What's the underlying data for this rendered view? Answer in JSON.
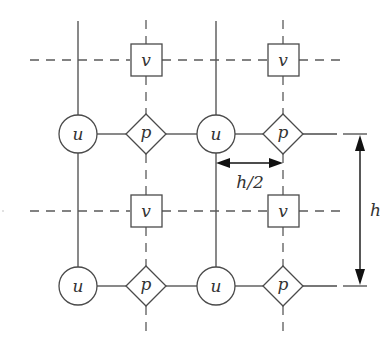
{
  "diagram": {
    "colors": {
      "line": "#4a4a4a",
      "dashed": "#5a5a5a",
      "dimension": "#111111",
      "text": "#333333",
      "background": "#ffffff"
    },
    "u_columns_x": [
      78,
      216
    ],
    "p_columns_x": [
      146,
      283
    ],
    "v_rows_y": [
      60,
      211
    ],
    "pu_rows_y": [
      134,
      286
    ],
    "legend_nodes": {
      "u": {
        "shape": "circle",
        "label": "u"
      },
      "v": {
        "shape": "square",
        "label": "v"
      },
      "p": {
        "shape": "diamond",
        "label": "p"
      }
    },
    "nodes": [
      {
        "type": "v",
        "label": "v",
        "x": 146,
        "y": 60
      },
      {
        "type": "v",
        "label": "v",
        "x": 283,
        "y": 60
      },
      {
        "type": "u",
        "label": "u",
        "x": 78,
        "y": 134
      },
      {
        "type": "p",
        "label": "p",
        "x": 146,
        "y": 134
      },
      {
        "type": "u",
        "label": "u",
        "x": 216,
        "y": 134
      },
      {
        "type": "p",
        "label": "p",
        "x": 283,
        "y": 134
      },
      {
        "type": "v",
        "label": "v",
        "x": 146,
        "y": 211
      },
      {
        "type": "v",
        "label": "v",
        "x": 283,
        "y": 211
      },
      {
        "type": "u",
        "label": "u",
        "x": 78,
        "y": 286
      },
      {
        "type": "p",
        "label": "p",
        "x": 146,
        "y": 286
      },
      {
        "type": "u",
        "label": "u",
        "x": 216,
        "y": 286
      },
      {
        "type": "p",
        "label": "p",
        "x": 283,
        "y": 286
      }
    ],
    "dimensions": {
      "half_spacing": {
        "label": "h/2",
        "from_x": 216,
        "to_x": 283,
        "y": 163
      },
      "spacing": {
        "label": "h",
        "x": 360,
        "from_y": 134,
        "to_y": 286
      }
    }
  }
}
